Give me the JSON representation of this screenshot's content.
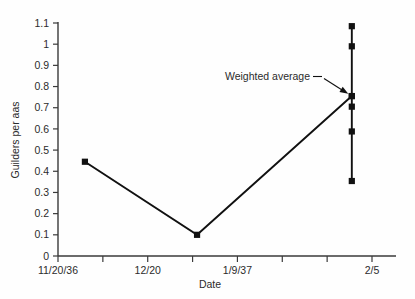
{
  "chart_data": {
    "type": "line",
    "title": "",
    "xlabel": "Date",
    "ylabel": "Guilders per aas",
    "ylim": [
      0,
      1.1
    ],
    "grid": false,
    "legend": null,
    "y_ticks": [
      "0",
      "0.1",
      "0.2",
      "0.3",
      "0.4",
      "0.5",
      "0.6",
      "0.7",
      "0.8",
      "0.9",
      "1",
      "1.1"
    ],
    "y_tick_values": [
      0,
      0.1,
      0.2,
      0.3,
      0.4,
      0.5,
      0.6,
      0.7,
      0.8,
      0.9,
      1.0,
      1.1
    ],
    "x_ticks": [
      {
        "pos": 0,
        "label": "11/20/36"
      },
      {
        "pos": 1,
        "label": ""
      },
      {
        "pos": 2,
        "label": "12/20"
      },
      {
        "pos": 3,
        "label": ""
      },
      {
        "pos": 4,
        "label": "1/9/37"
      },
      {
        "pos": 5,
        "label": ""
      },
      {
        "pos": 6,
        "label": ""
      },
      {
        "pos": 7,
        "label": "2/5"
      }
    ],
    "series": [
      {
        "name": "Weighted average",
        "x": [
          0.6,
          3.1,
          6.55
        ],
        "values": [
          0.445,
          0.1,
          0.755
        ]
      }
    ],
    "range_bar": {
      "x": 6.55,
      "low": 0.354,
      "high": 1.085,
      "points": [
        1.085,
        0.99,
        0.755,
        0.705,
        0.588,
        0.354
      ]
    },
    "annotations": [
      {
        "text": "Weighted average",
        "target_x": 6.55,
        "target_y": 0.755
      }
    ]
  },
  "colors": {
    "line": "#111111",
    "marker": "#111111",
    "axis": "#3a3a3a",
    "text": "#2b2b2b",
    "background": "#fefefe"
  }
}
